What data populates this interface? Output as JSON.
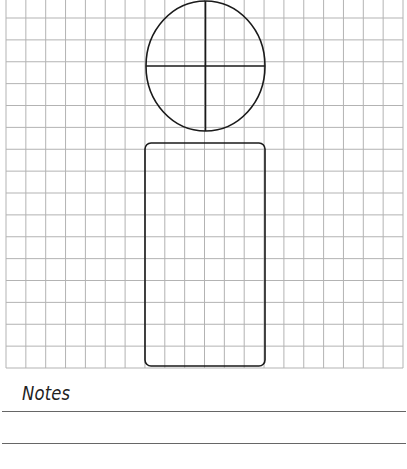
{
  "worksheet": {
    "grid": {
      "left": 6,
      "right": 403,
      "top": 18,
      "bottom": 368,
      "columns": 20,
      "rows": 16,
      "line_color": "#b3b3b3",
      "top_bleeds_off_page": true
    },
    "shapes": [
      {
        "type": "ellipse",
        "name": "head-circle",
        "cx": 205.5,
        "cy": 66,
        "rx": 59.5,
        "ry": 65,
        "dividers": [
          "vertical",
          "horizontal"
        ],
        "stroke": "#1a1a1a"
      },
      {
        "type": "rounded-rect",
        "name": "body-rectangle",
        "x": 145,
        "y": 143,
        "width": 120,
        "height": 223,
        "radius": 6,
        "stroke": "#1a1a1a"
      }
    ],
    "notes": {
      "title": "Notes",
      "lines": [
        412,
        444
      ],
      "line_color": "#666666"
    }
  }
}
